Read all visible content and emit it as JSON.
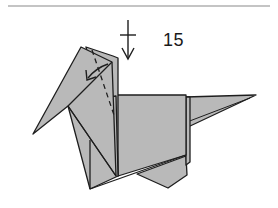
{
  "diagram": {
    "step_number": "15",
    "colors": {
      "paper_fill": "#b9b9b9",
      "line": "#1e1e1e",
      "rule": "#8a8a8a",
      "background": "#ffffff"
    },
    "symbols": [
      {
        "name": "push-down-arrow",
        "meaning": "push / fold downward"
      },
      {
        "name": "valley-fold-dashed-line"
      },
      {
        "name": "fold-direction-arrow"
      }
    ]
  }
}
